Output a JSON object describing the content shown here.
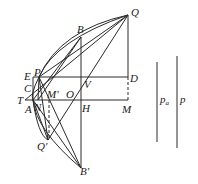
{
  "diagram": {
    "type": "geometry-figure",
    "points": {
      "Q": {
        "label": "Q",
        "x": 128,
        "y": 15
      },
      "B": {
        "label": "B",
        "x": 81,
        "y": 37
      },
      "E": {
        "label": "E",
        "x": 33,
        "y": 77
      },
      "P": {
        "label": "P",
        "x": 39,
        "y": 77
      },
      "V": {
        "label": "V",
        "x": 81,
        "y": 77
      },
      "D": {
        "label": "D",
        "x": 128,
        "y": 77
      },
      "C": {
        "label": "C",
        "x": 33,
        "y": 88
      },
      "T": {
        "label": "T",
        "x": 25,
        "y": 100
      },
      "A": {
        "label": "A",
        "x": 33,
        "y": 100
      },
      "N": {
        "label": "N",
        "x": 38,
        "y": 100
      },
      "M_prime": {
        "label": "M'",
        "x": 49,
        "y": 100
      },
      "O": {
        "label": "O",
        "x": 72,
        "y": 100
      },
      "H": {
        "label": "H",
        "x": 81,
        "y": 100
      },
      "M": {
        "label": "M",
        "x": 128,
        "y": 100
      },
      "Q_prime": {
        "label": "Q'",
        "x": 48,
        "y": 140
      },
      "B_prime": {
        "label": "B'",
        "x": 81,
        "y": 168
      }
    },
    "segments": {
      "p_a": {
        "label": "p",
        "subscript": "a",
        "x": 157,
        "y1": 62,
        "y2": 142
      },
      "p": {
        "label": "p",
        "x": 177,
        "y1": 56,
        "y2": 148
      }
    },
    "stroke_color": "#2a2a2a",
    "background": "#ffffff"
  }
}
